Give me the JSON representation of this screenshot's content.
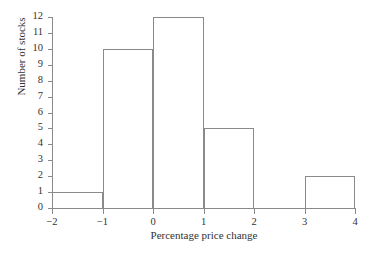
{
  "chart_data": {
    "type": "bar",
    "title": "",
    "subtitle": "",
    "xlabel": "Percentage price change",
    "ylabel": "Number of stocks",
    "grid": false,
    "legend": null,
    "legend_position": "none",
    "histogram": true,
    "bin_width": 1,
    "xlim": [
      -2,
      4
    ],
    "ylim": [
      0,
      12
    ],
    "xticks": [
      "−2",
      "−1",
      "0",
      "1",
      "2",
      "3",
      "4"
    ],
    "xtick_values": [
      -2,
      -1,
      0,
      1,
      2,
      3,
      4
    ],
    "yticks": [
      "0",
      "1",
      "2",
      "3",
      "4",
      "5",
      "6",
      "7",
      "8",
      "9",
      "10",
      "11",
      "12"
    ],
    "ytick_values": [
      0,
      1,
      2,
      3,
      4,
      5,
      6,
      7,
      8,
      9,
      10,
      11,
      12
    ],
    "categories": [
      "-2 to -1",
      "-1 to 0",
      "0 to 1",
      "1 to 2",
      "2 to 3",
      "3 to 4"
    ],
    "bins": [
      {
        "left": -2,
        "right": -1,
        "count": 1
      },
      {
        "left": -1,
        "right": 0,
        "count": 10
      },
      {
        "left": 0,
        "right": 1,
        "count": 12
      },
      {
        "left": 1,
        "right": 2,
        "count": 5
      },
      {
        "left": 2,
        "right": 3,
        "count": 0
      },
      {
        "left": 3,
        "right": 4,
        "count": 2
      }
    ],
    "values": [
      1,
      10,
      12,
      5,
      0,
      2
    ],
    "total": 30,
    "colors": {
      "background": "#ffffff",
      "bar_edge": "#8a8a8a",
      "bar_fill": "transparent",
      "axis": "#8a8a8a",
      "text": "#333333"
    }
  }
}
